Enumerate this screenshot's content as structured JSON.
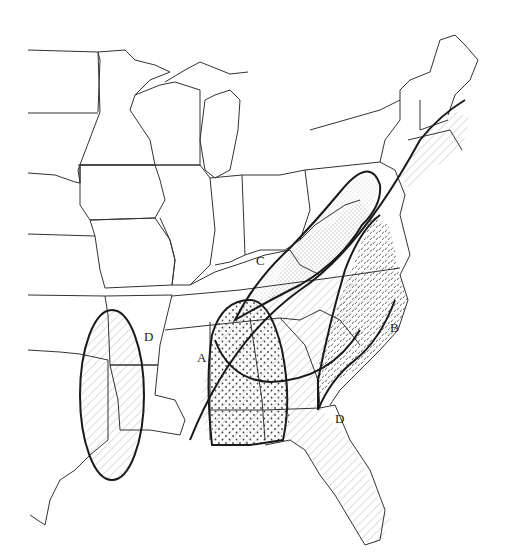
{
  "map": {
    "title": "",
    "background": "#ffffff",
    "line_color": "#1a1a1a",
    "labels": [
      {
        "id": "A",
        "text": "A",
        "x": 197,
        "y": 358
      },
      {
        "id": "B",
        "text": "B",
        "x": 392,
        "y": 330
      },
      {
        "id": "C",
        "text": "C",
        "x": 258,
        "y": 262
      },
      {
        "id": "D_west",
        "text": "D",
        "x": 146,
        "y": 338
      },
      {
        "id": "D_east",
        "text": "D",
        "x": 337,
        "y": 420
      }
    ],
    "regions": [
      {
        "id": "A",
        "label": "A",
        "pattern": "dots",
        "description": "Gulf coast / lower Mississippi range (dotted ellipse)"
      },
      {
        "id": "B",
        "label": "B",
        "pattern": "dashes",
        "description": "Atlantic coastal plain range (dashed)"
      },
      {
        "id": "C",
        "label": "C",
        "pattern": "stipple",
        "description": "Appalachian range (stippled)"
      },
      {
        "id": "D",
        "label": "D",
        "pattern": "diagonal-hatch",
        "description": "Southeast, Florida and east Texas range (hatched)"
      }
    ]
  }
}
